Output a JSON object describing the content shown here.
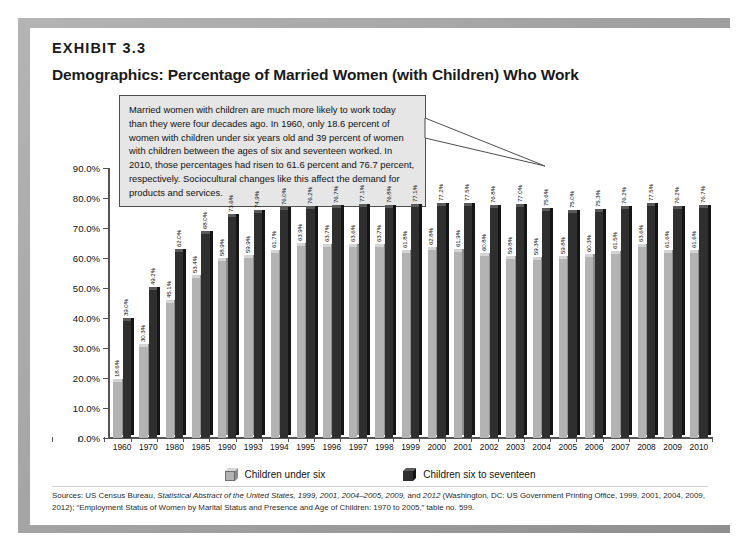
{
  "exhibit": {
    "label": "EXHIBIT 3.3",
    "title": "Demographics: Percentage of Married Women (with Children) Who Work"
  },
  "callout": {
    "text": "Married women with children are much more likely to work today than they were four decades ago. In 1960, only 18.6 percent of women with children under six years old and 39 percent of women with children between the ages of six and seventeen worked. In 2010, those percentages had risen to 61.6 percent and 76.7 percent, respectively. Sociocultural changes like this affect the demand for products and services."
  },
  "legend": {
    "items": [
      {
        "label": "Children under six",
        "color": "#b3b3b3"
      },
      {
        "label": "Children six to seventeen",
        "color": "#2f2f2f"
      }
    ]
  },
  "source": {
    "prefix": "Sources: US Census Bureau, ",
    "italic1": "Statistical Abstract of the United States, 1999, 2001, 2004–2005, 2009,",
    "mid": " and ",
    "italic2": "2012",
    "suffix": " (Washington, DC: US Government Printing Office, 1999, 2001, 2004, 2009, 2012); “Employment Status of Women by Marital Status and Presence and Age of Children: 1970 to 2005,” table no. 599."
  },
  "chart_data": {
    "type": "bar",
    "title": "Demographics: Percentage of Married Women (with Children) Who Work",
    "xlabel": "",
    "ylabel": "",
    "ylim": [
      0,
      90
    ],
    "grid": false,
    "legend_position": "bottom",
    "ytick_labels": [
      "0.0%",
      "10.0%",
      "20.0%",
      "30.0%",
      "40.0%",
      "50.0%",
      "60.0%",
      "70.0%",
      "80.0%",
      "90.0%"
    ],
    "ytick_values": [
      0,
      10,
      20,
      30,
      40,
      50,
      60,
      70,
      80,
      90
    ],
    "categories": [
      "1960",
      "1970",
      "1980",
      "1985",
      "1990",
      "1993",
      "1994",
      "1995",
      "1996",
      "1997",
      "1998",
      "1999",
      "2000",
      "2001",
      "2002",
      "2003",
      "2004",
      "2005",
      "2006",
      "2007",
      "2008",
      "2009",
      "2010"
    ],
    "series": [
      {
        "name": "Children under six",
        "color": "#b3b3b3",
        "values": [
          18.6,
          30.3,
          45.1,
          53.4,
          58.9,
          59.9,
          61.7,
          63.9,
          63.7,
          63.6,
          63.7,
          61.8,
          62.8,
          61.9,
          60.8,
          59.8,
          59.3,
          59.8,
          60.3,
          61.5,
          63.6,
          61.6,
          61.6
        ],
        "labels": [
          "18.6%",
          "30.3%",
          "45.1%",
          "53.4%",
          "58.9%",
          "59.9%",
          "61.7%",
          "63.9%",
          "63.7%",
          "63.6%",
          "63.7%",
          "61.8%",
          "62.8%",
          "61.9%",
          "60.8%",
          "59.8%",
          "59.3%",
          "59.8%",
          "60.3%",
          "61.5%",
          "63.6%",
          "61.6%",
          "61.6%"
        ]
      },
      {
        "name": "Children six to seventeen",
        "color": "#2f2f2f",
        "values": [
          39.0,
          49.2,
          62.0,
          68.0,
          73.6,
          74.9,
          76.0,
          76.2,
          76.7,
          77.1,
          76.8,
          77.1,
          77.2,
          77.5,
          76.8,
          77.0,
          75.6,
          75.0,
          75.3,
          76.2,
          77.5,
          76.2,
          76.7
        ],
        "labels": [
          "39.0%",
          "49.2%",
          "62.0%",
          "68.0%",
          "73.6%",
          "74.9%",
          "76.0%",
          "76.2%",
          "76.7%",
          "77.1%",
          "76.8%",
          "77.1%",
          "77.2%",
          "77.5%",
          "76.8%",
          "77.0%",
          "75.6%",
          "75.0%",
          "75.3%",
          "76.2%",
          "77.5%",
          "76.2%",
          "76.7%"
        ]
      }
    ]
  }
}
